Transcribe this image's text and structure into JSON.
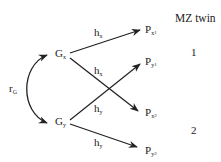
{
  "title": "MZ twin",
  "twins": [
    "1",
    "2"
  ],
  "correlation": {
    "symbol": "r",
    "sub": "G"
  },
  "genes": [
    {
      "id": "Gx",
      "symbol": "G",
      "sub": "x"
    },
    {
      "id": "Gy",
      "symbol": "G",
      "sub": "y"
    }
  ],
  "phenotypes": [
    {
      "id": "Px1",
      "symbol": "P",
      "sub": "x",
      "subsub": "1"
    },
    {
      "id": "Py1",
      "symbol": "P",
      "sub": "y",
      "subsub": "1"
    },
    {
      "id": "Px2",
      "symbol": "P",
      "sub": "x",
      "subsub": "2"
    },
    {
      "id": "Py2",
      "symbol": "P",
      "sub": "y",
      "subsub": "2"
    }
  ],
  "paths": [
    {
      "from": "Gx",
      "to": "Px1",
      "label": "h",
      "sub": "x"
    },
    {
      "from": "Gx",
      "to": "Px2",
      "label": "h",
      "sub": "x"
    },
    {
      "from": "Gy",
      "to": "Py1",
      "label": "h",
      "sub": "y"
    },
    {
      "from": "Gy",
      "to": "Py2",
      "label": "h",
      "sub": "y"
    }
  ]
}
